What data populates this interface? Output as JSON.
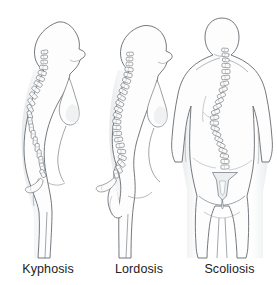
{
  "illustration": {
    "title": "Spinal curvature disorders",
    "background_color": "#ffffff",
    "outline_color": "#6d7277",
    "shade_color": "#e9ebec",
    "body_fill": "#fdfdfd",
    "vertebra_fill": "#fbfbfb",
    "label_color": "#222222",
    "figures": [
      {
        "id": "kyphosis-figure",
        "label": "Kyphosis",
        "view": "lateral-profile-facing-right",
        "spine_description": "Exaggerated outward rounding of the thoracic spine producing a hunched upper back",
        "sex_presentation": "female",
        "vertebra_count": 24,
        "sacrum_visible": true
      },
      {
        "id": "lordosis-figure",
        "label": "Lordosis",
        "view": "lateral-profile-facing-right",
        "spine_description": "Exaggerated inward curve of the lumbar spine producing a swayback with protruding abdomen and buttocks",
        "sex_presentation": "female",
        "vertebra_count": 24,
        "sacrum_visible": true
      },
      {
        "id": "scoliosis-figure",
        "label": "Scoliosis",
        "view": "posterior-rear",
        "spine_description": "Sideways S-shaped lateral curvature of the spine with uneven shoulders and hips",
        "sex_presentation": "female",
        "vertebra_count": 22,
        "sacrum_visible": true
      }
    ]
  },
  "labels": {
    "kyphosis": "Kyphosis",
    "lordosis": "Lordosis",
    "scoliosis": "Scoliosis"
  }
}
